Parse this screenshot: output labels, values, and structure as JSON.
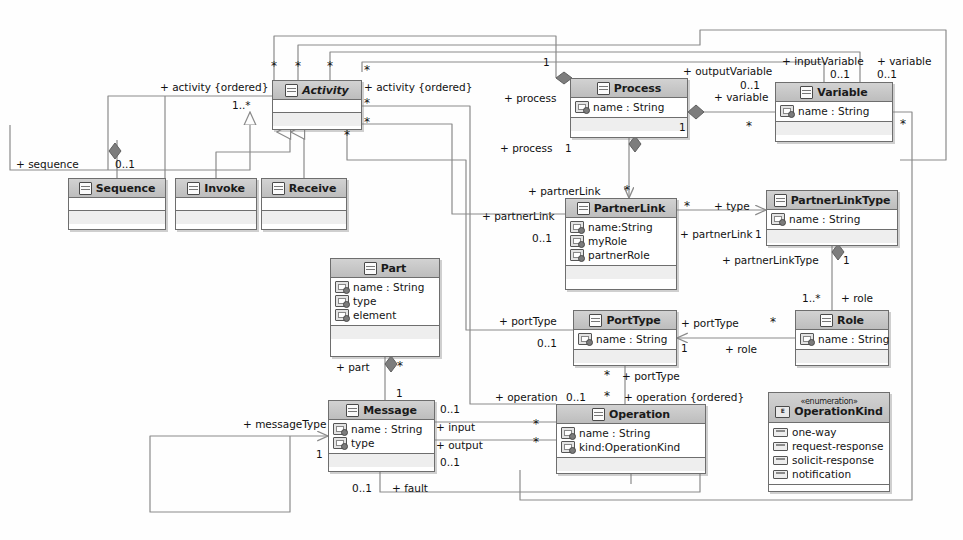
{
  "diagram": {
    "accent": "#bdbdbd",
    "line_color": "#8a8a8a"
  },
  "classes": [
    {
      "id": "activity",
      "name": "Activity",
      "italic": true,
      "stereotype": "",
      "attributes": [],
      "x": 272,
      "y": 80,
      "w": 90,
      "h": 50
    },
    {
      "id": "sequence",
      "name": "Sequence",
      "italic": false,
      "stereotype": "",
      "attributes": [],
      "x": 68,
      "y": 178,
      "w": 98,
      "h": 52
    },
    {
      "id": "invoke",
      "name": "Invoke",
      "italic": false,
      "stereotype": "",
      "attributes": [],
      "x": 175,
      "y": 178,
      "w": 82,
      "h": 52
    },
    {
      "id": "receive",
      "name": "Receive",
      "italic": false,
      "stereotype": "",
      "attributes": [],
      "x": 261,
      "y": 178,
      "w": 86,
      "h": 52
    },
    {
      "id": "process",
      "name": "Process",
      "italic": false,
      "stereotype": "",
      "attributes": [
        "name : String"
      ],
      "x": 570,
      "y": 78,
      "w": 118,
      "h": 60
    },
    {
      "id": "variable",
      "name": "Variable",
      "italic": false,
      "stereotype": "",
      "attributes": [
        "name : String"
      ],
      "x": 775,
      "y": 82,
      "w": 118,
      "h": 60
    },
    {
      "id": "partnerlink",
      "name": "PartnerLink",
      "italic": false,
      "stereotype": "",
      "attributes": [
        "name:String",
        "myRole",
        "partnerRole"
      ],
      "x": 565,
      "y": 198,
      "w": 112,
      "h": 92
    },
    {
      "id": "partnerlinktype",
      "name": "PartnerLinkType",
      "italic": false,
      "stereotype": "",
      "attributes": [
        "name : String"
      ],
      "x": 766,
      "y": 190,
      "w": 132,
      "h": 56
    },
    {
      "id": "porttype",
      "name": "PortType",
      "italic": false,
      "stereotype": "",
      "attributes": [
        "name : String"
      ],
      "x": 573,
      "y": 310,
      "w": 104,
      "h": 56
    },
    {
      "id": "role",
      "name": "Role",
      "italic": false,
      "stereotype": "",
      "attributes": [
        "name : String"
      ],
      "x": 795,
      "y": 310,
      "w": 94,
      "h": 56
    },
    {
      "id": "part",
      "name": "Part",
      "italic": false,
      "stereotype": "",
      "attributes": [
        "name : String",
        "type",
        "element"
      ],
      "x": 330,
      "y": 258,
      "w": 110,
      "h": 99
    },
    {
      "id": "message",
      "name": "Message",
      "italic": false,
      "stereotype": "",
      "attributes": [
        "name : String",
        "type"
      ],
      "x": 328,
      "y": 400,
      "w": 107,
      "h": 72
    },
    {
      "id": "operation",
      "name": "Operation",
      "italic": false,
      "stereotype": "",
      "attributes": [
        "name : String",
        "kind:OperationKind"
      ],
      "x": 556,
      "y": 404,
      "w": 150,
      "h": 70
    },
    {
      "id": "operationkind",
      "name": "OperationKind",
      "italic": false,
      "stereotype": "«enumeration»",
      "literals": [
        "one-way",
        "request-response",
        "solicit-response",
        "notification"
      ],
      "x": 768,
      "y": 392,
      "w": 122,
      "h": 100
    }
  ],
  "edge_labels": [
    {
      "id": "l-activity-ordered-left",
      "text": "+ activity {ordered}",
      "x": 160,
      "y": 82
    },
    {
      "id": "l-activity-ordered-left-mult",
      "text": "1..*",
      "x": 232,
      "y": 100
    },
    {
      "id": "l-activity-ordered-right",
      "text": "+ activity {ordered}",
      "x": 364,
      "y": 82
    },
    {
      "id": "l-sequence",
      "text": "+ sequence",
      "x": 16,
      "y": 159
    },
    {
      "id": "l-sequence-mult",
      "text": "0..1",
      "x": 115,
      "y": 159
    },
    {
      "id": "l-process-left",
      "text": "+ process",
      "x": 504,
      "y": 93
    },
    {
      "id": "l-process-down",
      "text": "+ process",
      "x": 500,
      "y": 143
    },
    {
      "id": "l-process-down-mult",
      "text": "1",
      "x": 565,
      "y": 143
    },
    {
      "id": "l-process-top-mult",
      "text": "1",
      "x": 543,
      "y": 57
    },
    {
      "id": "l-outputvariable",
      "text": "+ outputVariable",
      "x": 683,
      "y": 66
    },
    {
      "id": "l-outputvariable-mult",
      "text": "0..1",
      "x": 740,
      "y": 80
    },
    {
      "id": "l-variable-right",
      "text": "+ variable",
      "x": 714,
      "y": 92
    },
    {
      "id": "l-process-variable-mult",
      "text": "1",
      "x": 679,
      "y": 122
    },
    {
      "id": "l-variable-star",
      "text": "*",
      "x": 746,
      "y": 122
    },
    {
      "id": "l-inputvariable",
      "text": "+ inputVariable",
      "x": 782,
      "y": 56
    },
    {
      "id": "l-inputvariable-mult",
      "text": "0..1",
      "x": 830,
      "y": 69
    },
    {
      "id": "l-variable-top",
      "text": "+ variable",
      "x": 877,
      "y": 56
    },
    {
      "id": "l-variable-top-mult",
      "text": "0..1",
      "x": 877,
      "y": 69
    },
    {
      "id": "l-variable-star-right",
      "text": "*",
      "x": 900,
      "y": 120
    },
    {
      "id": "l-partnerlink-down",
      "text": "+ partnerLink",
      "x": 528,
      "y": 186
    },
    {
      "id": "l-partnerlink-down-star",
      "text": "*",
      "x": 624,
      "y": 186
    },
    {
      "id": "l-partnerlink-left",
      "text": "+ partnerLink",
      "x": 482,
      "y": 211
    },
    {
      "id": "l-partnerlink-left-mult",
      "text": "0..1",
      "x": 532,
      "y": 233
    },
    {
      "id": "l-partnerlink-star",
      "text": "*",
      "x": 684,
      "y": 202
    },
    {
      "id": "l-type-plt",
      "text": "+ type",
      "x": 714,
      "y": 201
    },
    {
      "id": "l-partnerlink-plt",
      "text": "+ partnerLink",
      "x": 680,
      "y": 229
    },
    {
      "id": "l-partnerlink-plt-mult",
      "text": "1",
      "x": 755,
      "y": 229
    },
    {
      "id": "l-partnerlinktype",
      "text": "+ partnerLinkType",
      "x": 722,
      "y": 255
    },
    {
      "id": "l-partnerlinktype-mult",
      "text": "1",
      "x": 843,
      "y": 255
    },
    {
      "id": "l-role-mult",
      "text": "1..*",
      "x": 802,
      "y": 293
    },
    {
      "id": "l-role",
      "text": "+ role",
      "x": 841,
      "y": 293
    },
    {
      "id": "l-porttype-left",
      "text": "+ portType",
      "x": 499,
      "y": 316
    },
    {
      "id": "l-porttype-left-mult",
      "text": "0..1",
      "x": 537,
      "y": 338
    },
    {
      "id": "l-porttype-right",
      "text": "+ portType",
      "x": 681,
      "y": 318
    },
    {
      "id": "l-porttype-right-star",
      "text": "*",
      "x": 770,
      "y": 318
    },
    {
      "id": "l-porttype-right-mult",
      "text": "1",
      "x": 681,
      "y": 343
    },
    {
      "id": "l-role-right",
      "text": "+ role",
      "x": 725,
      "y": 344
    },
    {
      "id": "l-porttype-down-star",
      "text": "*",
      "x": 604,
      "y": 371
    },
    {
      "id": "l-porttype-down",
      "text": "+ portType",
      "x": 622,
      "y": 371
    },
    {
      "id": "l-part",
      "text": "+ part",
      "x": 336,
      "y": 362
    },
    {
      "id": "l-part-star",
      "text": "*",
      "x": 397,
      "y": 362
    },
    {
      "id": "l-part-mult",
      "text": "1",
      "x": 396,
      "y": 388
    },
    {
      "id": "l-messagetype",
      "text": "+ messageType",
      "x": 243,
      "y": 419
    },
    {
      "id": "l-messagetype-mult",
      "text": "1",
      "x": 316,
      "y": 449
    },
    {
      "id": "l-operation",
      "text": "+ operation",
      "x": 495,
      "y": 392
    },
    {
      "id": "l-operation-mult",
      "text": "0..1",
      "x": 566,
      "y": 392
    },
    {
      "id": "l-operation-star",
      "text": "*",
      "x": 604,
      "y": 392
    },
    {
      "id": "l-operation-ordered",
      "text": "+ operation {ordered}",
      "x": 624,
      "y": 392
    },
    {
      "id": "l-input",
      "text": "+ input",
      "x": 436,
      "y": 422
    },
    {
      "id": "l-input-mult",
      "text": "0..1",
      "x": 440,
      "y": 404
    },
    {
      "id": "l-input-star",
      "text": "*",
      "x": 533,
      "y": 420
    },
    {
      "id": "l-output",
      "text": "+ output",
      "x": 436,
      "y": 440
    },
    {
      "id": "l-output-star",
      "text": "*",
      "x": 533,
      "y": 438
    },
    {
      "id": "l-output-mult",
      "text": "0..1",
      "x": 440,
      "y": 457
    },
    {
      "id": "l-fault-mult",
      "text": "0..1",
      "x": 352,
      "y": 483
    },
    {
      "id": "l-fault",
      "text": "+ fault",
      "x": 392,
      "y": 483
    },
    {
      "id": "l-star-a1",
      "text": "*",
      "x": 271,
      "y": 62
    },
    {
      "id": "l-star-a2",
      "text": "*",
      "x": 295,
      "y": 62
    },
    {
      "id": "l-star-a3",
      "text": "*",
      "x": 327,
      "y": 62
    },
    {
      "id": "l-star-a4",
      "text": "*",
      "x": 364,
      "y": 66
    },
    {
      "id": "l-star-a5",
      "text": "*",
      "x": 364,
      "y": 99
    },
    {
      "id": "l-star-a6",
      "text": "*",
      "x": 364,
      "y": 118
    },
    {
      "id": "l-star-a7",
      "text": "*",
      "x": 344,
      "y": 131
    }
  ]
}
